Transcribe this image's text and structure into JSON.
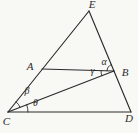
{
  "figure": {
    "background": "#f8f8f5",
    "line_color": "#2b2b2b",
    "vertices": {
      "E": {
        "label": "E"
      },
      "A": {
        "label": "A"
      },
      "B": {
        "label": "B"
      },
      "C": {
        "label": "C"
      },
      "D": {
        "label": "D"
      }
    },
    "angles": {
      "alpha": {
        "label": "α",
        "at_vertex": "B"
      },
      "gamma": {
        "label": "γ",
        "at_vertex": "B"
      },
      "beta": {
        "label": "β",
        "at_vertex": "C"
      },
      "theta": {
        "label": "θ",
        "at_vertex": "C"
      }
    }
  }
}
